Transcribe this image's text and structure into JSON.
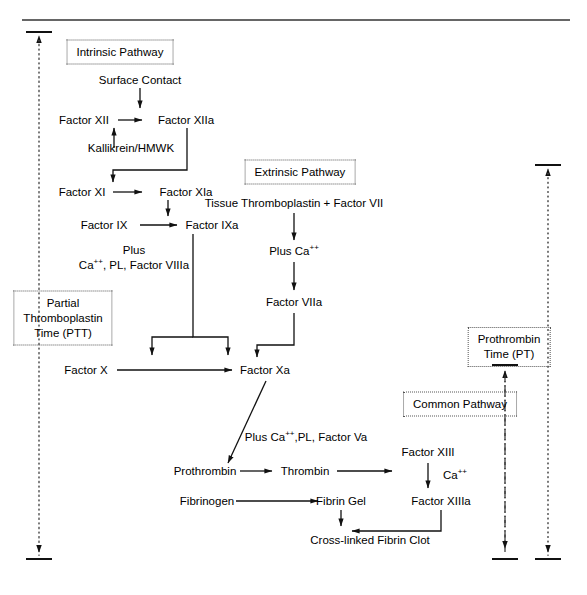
{
  "diagram": {
    "type": "flow-diagram",
    "ink_color": "#000000",
    "box_border_color": "#555555",
    "background": "#ffffff"
  },
  "pathway_boxes": [
    {
      "id": "intrinsic",
      "label": "Intrinsic Pathway"
    },
    {
      "id": "extrinsic",
      "label": "Extrinsic Pathway"
    },
    {
      "id": "ptt",
      "label": "Partial\nThromboplastin\nTime (PTT)",
      "line1": "Partial",
      "line2": "Thromboplastin",
      "line3": "Time (PTT)"
    },
    {
      "id": "pt",
      "label": "Prothrombin\nTime (PT)",
      "line1": "Prothrombin",
      "line2": "Time (PT)"
    },
    {
      "id": "common",
      "label": "Common Pathway"
    }
  ],
  "nodes": {
    "surface_contact": "Surface Contact",
    "factor_xii": "Factor XII",
    "factor_xiia": "Factor XIIa",
    "kallikrein": "Kallikrein/HMWK",
    "factor_xi": "Factor XI",
    "factor_xia": "Factor XIa",
    "factor_ix": "Factor IX",
    "factor_ixa": "Factor IXa",
    "plus_intrinsic_line1": "Plus",
    "plus_intrinsic_line2_a": "Ca",
    "plus_intrinsic_line2_sup": "++",
    "plus_intrinsic_line2_b": ", PL, Factor VIIIa",
    "tissue_thromboplastin": "Tissue Thromboplastin + Factor VII",
    "plus_ca_a": "Plus Ca",
    "plus_ca_sup": "++",
    "factor_viia": "Factor VIIa",
    "factor_x": "Factor X",
    "factor_xa": "Factor Xa",
    "plus_common_a": "Plus Ca",
    "plus_common_sup": "++",
    "plus_common_b": ",PL, Factor Va",
    "prothrombin": "Prothrombin",
    "thrombin": "Thrombin",
    "fibrinogen": "Fibrinogen",
    "fibrin_gel": "Fibrin Gel",
    "factor_xiii": "Factor XIII",
    "ca_cofactor_a": "Ca",
    "ca_cofactor_sup": "++",
    "factor_xiiia": "Factor XIIIa",
    "cross_linked_clot": "Cross-linked Fibrin Clot"
  },
  "span_markers": {
    "ptt_span": {
      "style": "dotted",
      "orientation": "vertical",
      "arrow_top": true,
      "arrow_bottom": true
    },
    "pt_span": {
      "style": "dotted",
      "orientation": "vertical",
      "arrow_top": true,
      "arrow_bottom": true
    },
    "common_span": {
      "style": "dash-dot",
      "orientation": "vertical",
      "arrow_top": true,
      "arrow_bottom": true
    }
  }
}
